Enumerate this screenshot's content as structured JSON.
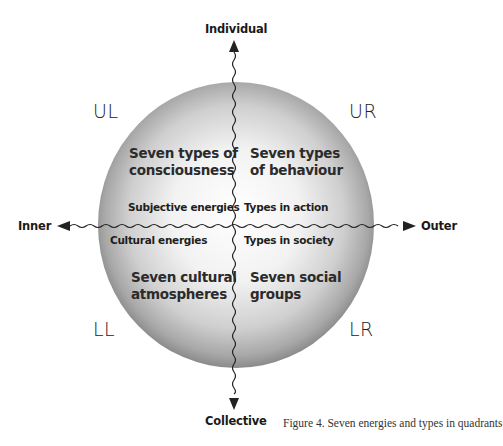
{
  "axes": {
    "top": "Individual",
    "bottom": "Collective",
    "left": "Inner",
    "right": "Outer"
  },
  "quadrants": {
    "ul": {
      "code": "UL",
      "title_line1": "Seven types of",
      "title_line2": "consciousness",
      "subtitle": "Subjective energies"
    },
    "ur": {
      "code": "UR",
      "title_line1": "Seven types",
      "title_line2": "of behaviour",
      "subtitle": "Types in action"
    },
    "ll": {
      "code": "LL",
      "title_line1": "Seven cultural",
      "title_line2": "atmospheres",
      "subtitle": "Cultural energies"
    },
    "lr": {
      "code": "LR",
      "title_line1": "Seven social",
      "title_line2": "groups",
      "subtitle": "Types in society"
    }
  },
  "caption": "Figure 4. Seven energies and types in quadrants",
  "colors": {
    "sphere_highlight": "#ffffff",
    "sphere_mid": "#d9d9d9",
    "sphere_edge": "#8c8c8c",
    "line": "#222222"
  }
}
